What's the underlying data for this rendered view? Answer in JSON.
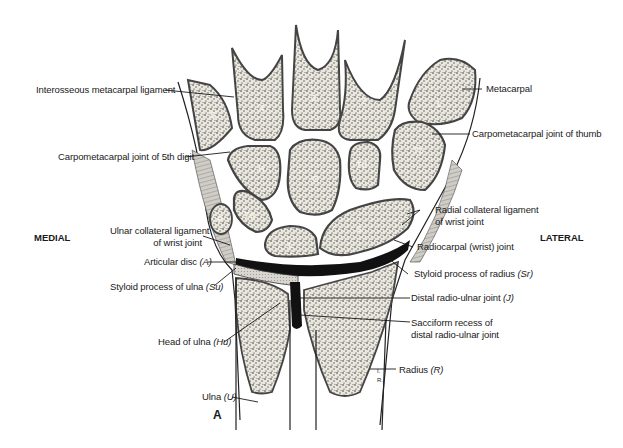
{
  "figure": {
    "panel_letter": "A",
    "orientation": {
      "left": "MEDIAL",
      "right": "LATERAL"
    },
    "bone_markers": {
      "metacarpals": [
        "1",
        "2",
        "3",
        "4",
        "5"
      ],
      "carpals": {
        "hamate": "H",
        "capitate": "C",
        "trapezoid": "Td",
        "trapezium": "Tz",
        "triquetrum": "Tq",
        "pisiform": "P",
        "lunate": "L",
        "scaphoid": "S"
      },
      "artist_initials": "I.R."
    },
    "labels_left": [
      {
        "id": "interosseous",
        "text": "Interosseous metacarpal ligament",
        "abbr": ""
      },
      {
        "id": "cmc5",
        "text": "Carpometacarpal joint of 5th digit",
        "abbr": ""
      },
      {
        "id": "ulnar-collateral-1",
        "text": "Ulnar collateral ligament",
        "abbr": ""
      },
      {
        "id": "ulnar-collateral-2",
        "text": "of wrist joint",
        "abbr": ""
      },
      {
        "id": "articular-disc",
        "text": "Articular disc ",
        "abbr": "(A)"
      },
      {
        "id": "styloid-ulna",
        "text": "Styloid process of ulna ",
        "abbr": "(Su)"
      },
      {
        "id": "head-ulna",
        "text": "Head of ulna ",
        "abbr": "(Hu)"
      },
      {
        "id": "ulna",
        "text": "Ulna ",
        "abbr": "(U)"
      }
    ],
    "labels_right": [
      {
        "id": "metacarpal",
        "text": "Metacarpal",
        "abbr": ""
      },
      {
        "id": "cmc-thumb",
        "text": "Carpometacarpal joint of thumb",
        "abbr": ""
      },
      {
        "id": "radial-collateral-1",
        "text": "Radial collateral ligament",
        "abbr": ""
      },
      {
        "id": "radial-collateral-2",
        "text": "of wrist joint",
        "abbr": ""
      },
      {
        "id": "radiocarpal",
        "text": "Radiocarpal (wrist) joint",
        "abbr": ""
      },
      {
        "id": "styloid-radius",
        "text": "Styloid process of radius ",
        "abbr": "(Sr)"
      },
      {
        "id": "distal-radioulnar",
        "text": "Distal radio-ulnar joint ",
        "abbr": "(J)"
      },
      {
        "id": "sacciform-1",
        "text": "Sacciform recess of",
        "abbr": ""
      },
      {
        "id": "sacciform-2",
        "text": "distal radio-ulnar joint",
        "abbr": ""
      },
      {
        "id": "radius",
        "text": "Radius ",
        "abbr": "(R)"
      }
    ],
    "colors": {
      "ink": "#1a1a1a",
      "bone_fill": "#ecebe4",
      "cortex": "#9a9890",
      "cartilage": "#d9d7cf",
      "joint_cavity": "#111111"
    }
  }
}
